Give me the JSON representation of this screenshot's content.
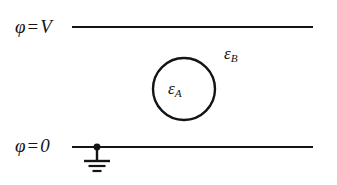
{
  "figure": {
    "background_color": "#ffffff",
    "stroke_color": "#141414",
    "width": 337,
    "height": 185
  },
  "labels": {
    "top_potential": {
      "symbol": "φ",
      "operator": "=",
      "value": "V",
      "full_text": "φ = V"
    },
    "bottom_potential": {
      "symbol": "φ",
      "operator": "=",
      "value": "0",
      "full_text": "φ = 0"
    },
    "inner_permittivity": {
      "symbol": "ε",
      "subscript": "A",
      "full_text": "εA"
    },
    "outer_permittivity": {
      "symbol": "ε",
      "subscript": "B",
      "full_text": "εB"
    }
  },
  "elements": {
    "top_electrode": {
      "name": "top-electrode-line",
      "x1": 72,
      "x2": 313,
      "y": 27,
      "stroke_width": 2.2
    },
    "bottom_electrode": {
      "name": "bottom-electrode-line",
      "x1": 72,
      "x2": 313,
      "y": 147,
      "stroke_width": 2.2
    },
    "sphere": {
      "name": "dielectric-sphere",
      "cx": 184,
      "cy": 89,
      "r": 31,
      "stroke_width": 2.4,
      "fill": "none"
    },
    "ground_node": {
      "name": "ground-connection-dot",
      "cx": 97,
      "cy": 147,
      "r": 3.4
    },
    "ground_symbol": {
      "name": "ground-symbol",
      "stem_x": 97,
      "stem_y1": 147,
      "stem_y2": 161,
      "bars": [
        {
          "half_width": 13,
          "y": 161,
          "stroke_width": 2.4
        },
        {
          "half_width": 8.5,
          "y": 166,
          "stroke_width": 2.2
        },
        {
          "half_width": 4.5,
          "y": 171,
          "stroke_width": 2.2
        }
      ]
    }
  }
}
